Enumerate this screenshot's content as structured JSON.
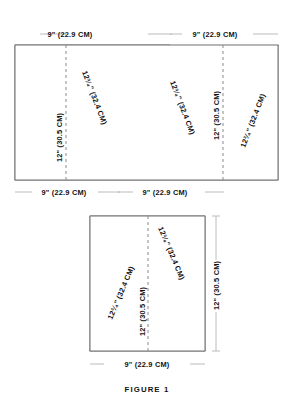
{
  "figure": {
    "caption": "FIGURE 1",
    "caption_lead": "F",
    "caption_rest": "IGURE 1"
  },
  "labels": {
    "width_9in": "9\" (22.9 CM)",
    "height_12in": "12\" (30.5 CM)",
    "side_12_75in": "12³⁄₄\" (32.4 CM)",
    "side_whole": "12",
    "side_fraction": "3/4",
    "side_inch_mark": "\"",
    "side_metric": " (32.4 CM)",
    "width_whole": "9",
    "width_inch_mark": "\"",
    "width_metric": " (22.9 CM)",
    "height_whole": "12",
    "height_inch_mark": "\"",
    "height_metric": " (30.5 CM)"
  },
  "colors": {
    "gray_fill": "#cfcfcf",
    "white_fill": "#ffffff",
    "outline": "#6f6f6f",
    "dash": "#8a8a8a",
    "dim_line": "#b4b4b4",
    "text": "#111111",
    "background": "#ffffff"
  },
  "top_diagram": {
    "name": "strip-layout-zigzag",
    "description": "Rectangular fabric strip marked with alternating triangles",
    "top_dim_labels": [
      "9\" (22.9 CM)",
      "9\" (22.9 CM)"
    ],
    "bottom_dim_labels": [
      "9\" (22.9 CM)",
      "9\" (22.9 CM)"
    ],
    "vertical_dim_labels": [
      "12\" (30.5 CM)",
      "12\" (30.5 CM)"
    ],
    "diagonal_dim_labels": [
      "12³⁄₄\" (32.4 CM)",
      "12³⁄₄\" (32.4 CM)",
      "12³⁄₄\" (32.4 CM)"
    ],
    "gray_piece_count": 3,
    "white_piece_count": 3
  },
  "bottom_diagram": {
    "name": "single-triangle-layout",
    "description": "Rectangle with one centered white triangle and gray corner waste",
    "bottom_dim_label": "9\" (22.9 CM)",
    "right_dim_label": "12\" (30.5 CM)",
    "center_dim_label": "12\" (30.5 CM)",
    "diagonal_dim_labels": [
      "12³⁄₄\" (32.4 CM)",
      "12³⁄₄\" (32.4 CM)"
    ]
  }
}
